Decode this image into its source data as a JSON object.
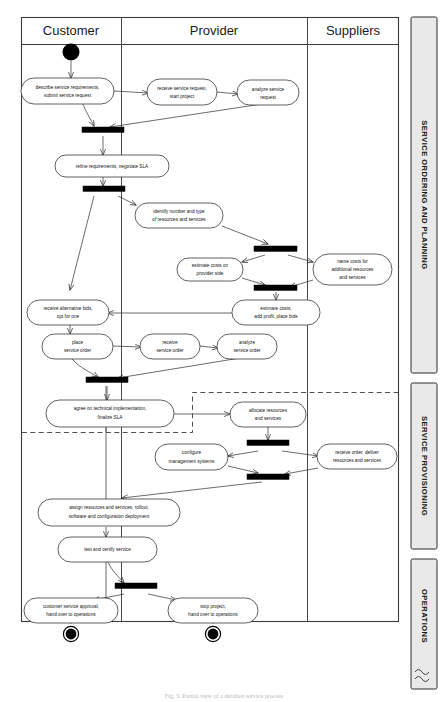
{
  "figure": {
    "caption": "Fig. 3. Partial view of a detailed service process"
  },
  "lanes": [
    {
      "id": "customer",
      "label": "Customer"
    },
    {
      "id": "provider",
      "label": "Provider"
    },
    {
      "id": "suppliers",
      "label": "Suppliers"
    }
  ],
  "phases": [
    {
      "id": "ordering",
      "label": "SERVICE ORDERING AND PLANNING"
    },
    {
      "id": "provisioning",
      "label": "SERVICE PROVISIONING"
    },
    {
      "id": "operations",
      "label": "OPERATIONS"
    }
  ],
  "nodes": [
    {
      "id": "n01",
      "lane": "customer",
      "lines": [
        "describe service requirements,",
        "submit service request"
      ]
    },
    {
      "id": "n02",
      "lane": "provider",
      "lines": [
        "receive service request,",
        "start project"
      ]
    },
    {
      "id": "n03",
      "lane": "provider",
      "lines": [
        "analyze service",
        "request"
      ]
    },
    {
      "id": "n04",
      "lane": "customer",
      "lines": [
        "refine requirements, negotiate SLA"
      ]
    },
    {
      "id": "n05",
      "lane": "provider",
      "lines": [
        "identify number and type",
        "of resources and services"
      ]
    },
    {
      "id": "n06",
      "lane": "provider",
      "lines": [
        "estimate costs on",
        "provider side"
      ]
    },
    {
      "id": "n07",
      "lane": "suppliers",
      "lines": [
        "name costs for",
        "additional resources",
        "and services"
      ]
    },
    {
      "id": "n08",
      "lane": "provider",
      "lines": [
        "estimate costs,",
        "add profit, place bids"
      ]
    },
    {
      "id": "n09",
      "lane": "customer",
      "lines": [
        "receive alternative bids,",
        "opt for one"
      ]
    },
    {
      "id": "n10",
      "lane": "customer",
      "lines": [
        "place",
        "service order"
      ]
    },
    {
      "id": "n11",
      "lane": "provider",
      "lines": [
        "receive",
        "service order"
      ]
    },
    {
      "id": "n12",
      "lane": "provider",
      "lines": [
        "analyze",
        "service order"
      ]
    },
    {
      "id": "n13",
      "lane": "customer",
      "lines": [
        "agree on technical implementation,",
        "finalize SLA"
      ]
    },
    {
      "id": "n14",
      "lane": "provider",
      "lines": [
        "allocate resources",
        "and services"
      ]
    },
    {
      "id": "n15",
      "lane": "provider",
      "lines": [
        "configure",
        "management systems"
      ]
    },
    {
      "id": "n16",
      "lane": "suppliers",
      "lines": [
        "receive order, deliver",
        "resources and services"
      ]
    },
    {
      "id": "n17",
      "lane": "customer",
      "lines": [
        "assign resources and services, rollout,",
        "software and configuration deployment"
      ]
    },
    {
      "id": "n18",
      "lane": "customer",
      "lines": [
        "test and certify service"
      ]
    },
    {
      "id": "n19",
      "lane": "customer",
      "lines": [
        "customer service approval,",
        "hand over to operations"
      ]
    },
    {
      "id": "n20",
      "lane": "provider",
      "lines": [
        "stop project,",
        "hand over to operations"
      ]
    }
  ],
  "markers": {
    "start_count": 1,
    "end_count": 2,
    "sync_bar_count": 8
  },
  "colors": {
    "stroke": "#2b2b2b",
    "frame": "#3b3b3b",
    "bar_fill": "#000000",
    "phase_fill": "#e9e9e9",
    "background": "#ffffff"
  }
}
